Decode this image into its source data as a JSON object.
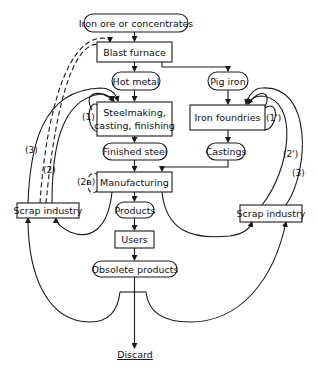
{
  "diagram": {
    "type": "flowchart",
    "nodes": {
      "iron_ore": {
        "label": "Iron ore or concentrates",
        "shape": "rounded"
      },
      "blast_furnace": {
        "label": "Blast furnace",
        "shape": "box"
      },
      "hot_metal": {
        "label": "Hot metal",
        "shape": "rounded"
      },
      "pig_iron": {
        "label": "Pig iron",
        "shape": "rounded"
      },
      "steelmaking_line1": {
        "label": "Steelmaking,",
        "shape": "box"
      },
      "steelmaking_line2": {
        "label": "casting, finishing",
        "shape": "box"
      },
      "iron_foundries": {
        "label": "Iron foundries",
        "shape": "box"
      },
      "finished_steel": {
        "label": "Finished steel",
        "shape": "rounded"
      },
      "castings": {
        "label": "Castings",
        "shape": "rounded"
      },
      "manufacturing": {
        "label": "Manufacturing",
        "shape": "box"
      },
      "products": {
        "label": "Products",
        "shape": "rounded"
      },
      "users": {
        "label": "Users",
        "shape": "box"
      },
      "obsolete_products": {
        "label": "Obsolete products",
        "shape": "rounded"
      },
      "scrap_left": {
        "label": "Scrap industry",
        "shape": "box"
      },
      "scrap_right": {
        "label": "Scrap industry",
        "shape": "box"
      },
      "discard": {
        "label": "Discard",
        "shape": "text-underlined"
      }
    },
    "loop_labels": {
      "l1": "(1)",
      "l1p": "(1')",
      "l2": "(2)",
      "l2p": "(2')",
      "l2a": "(2a)",
      "l3_left": "(3)",
      "l3_right": "(3)"
    },
    "edges": [
      {
        "from": "Iron ore or concentrates",
        "to": "Blast furnace",
        "style": "solid"
      },
      {
        "from": "Blast furnace",
        "to": "Hot metal",
        "style": "solid"
      },
      {
        "from": "Blast furnace",
        "to": "Pig iron",
        "style": "solid"
      },
      {
        "from": "Hot metal",
        "to": "Steelmaking, casting, finishing",
        "style": "solid"
      },
      {
        "from": "Pig iron",
        "to": "Iron foundries",
        "style": "solid"
      },
      {
        "from": "Steelmaking, casting, finishing",
        "to": "Finished steel",
        "style": "solid"
      },
      {
        "from": "Iron foundries",
        "to": "Castings",
        "style": "solid"
      },
      {
        "from": "Finished steel",
        "to": "Manufacturing",
        "style": "solid"
      },
      {
        "from": "Castings",
        "to": "Manufacturing",
        "style": "solid"
      },
      {
        "from": "Manufacturing",
        "to": "Products",
        "style": "solid"
      },
      {
        "from": "Products",
        "to": "Users",
        "style": "solid"
      },
      {
        "from": "Users",
        "to": "Obsolete products",
        "style": "solid"
      },
      {
        "from": "Obsolete products",
        "to": "Discard",
        "style": "solid"
      },
      {
        "from": "Steelmaking, casting, finishing",
        "to": "Steelmaking, casting, finishing",
        "label": "(1)",
        "style": "solid"
      },
      {
        "from": "Iron foundries",
        "to": "Iron foundries",
        "label": "(1')",
        "style": "solid"
      },
      {
        "from": "Manufacturing",
        "to": "Manufacturing",
        "label": "(2a)",
        "style": "dashed"
      },
      {
        "from": "Scrap industry (left)",
        "to": "Steelmaking, casting, finishing",
        "label": "(2)",
        "style": "solid"
      },
      {
        "from": "Scrap industry (left)",
        "to": "Steelmaking, casting, finishing",
        "label": "(3)",
        "style": "solid"
      },
      {
        "from": "Scrap industry (left)",
        "to": "Blast furnace",
        "style": "dashed"
      },
      {
        "from": "Scrap industry (right)",
        "to": "Iron foundries",
        "label": "(2')",
        "style": "solid"
      },
      {
        "from": "Scrap industry (right)",
        "to": "Iron foundries",
        "label": "(3)",
        "style": "solid"
      },
      {
        "from": "Manufacturing",
        "to": "Scrap industry (left)",
        "style": "solid"
      },
      {
        "from": "Manufacturing",
        "to": "Scrap industry (right)",
        "style": "solid"
      },
      {
        "from": "Obsolete products",
        "to": "Scrap industry (left)",
        "style": "solid"
      },
      {
        "from": "Obsolete products",
        "to": "Scrap industry (right)",
        "style": "solid"
      }
    ]
  }
}
